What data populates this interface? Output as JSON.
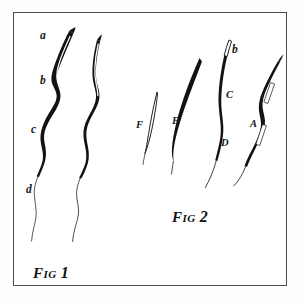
{
  "plate": {
    "background_color": "#ffffff",
    "border_color": "#4a4a4f",
    "ink_color": "#121214"
  },
  "figures": [
    {
      "id": "fig-1",
      "caption_prefix": "F",
      "caption_small": "IG",
      "caption_number": "1",
      "caption_text": "FIG 1",
      "specimen_count": 2,
      "labels": [
        {
          "key": "a",
          "text": "a",
          "case": "lower"
        },
        {
          "key": "b",
          "text": "b",
          "case": "lower"
        },
        {
          "key": "c",
          "text": "c",
          "case": "lower"
        },
        {
          "key": "d",
          "text": "d",
          "case": "lower"
        }
      ]
    },
    {
      "id": "fig-2",
      "caption_prefix": "F",
      "caption_small": "IG",
      "caption_number": "2",
      "caption_text": "FIG 2",
      "specimen_count": 4,
      "labels": [
        {
          "key": "F",
          "text": "F",
          "case": "upper"
        },
        {
          "key": "E",
          "text": "E",
          "case": "upper"
        },
        {
          "key": "b",
          "text": "b",
          "case": "lower"
        },
        {
          "key": "C",
          "text": "C",
          "case": "upper"
        },
        {
          "key": "D",
          "text": "D",
          "case": "upper"
        },
        {
          "key": "A",
          "text": "A",
          "case": "upper"
        }
      ]
    }
  ]
}
